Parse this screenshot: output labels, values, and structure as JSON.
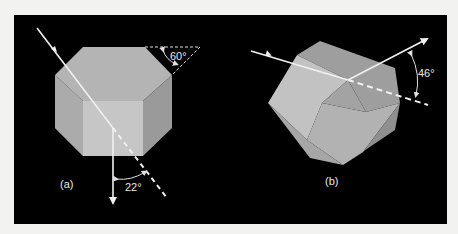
{
  "figure": {
    "background_color": "#000000",
    "page_color": "#f2f2f0",
    "crystal_color": "#bdbdbd",
    "ray_color": "#f0f0f0",
    "panels": [
      {
        "id": "a",
        "label": "(a)",
        "angles": [
          {
            "name": "face-angle",
            "text": "60°"
          },
          {
            "name": "deviation-angle",
            "text": "22°"
          }
        ]
      },
      {
        "id": "b",
        "label": "(b)",
        "angles": [
          {
            "name": "deviation-angle",
            "text": "46°"
          }
        ]
      }
    ]
  }
}
